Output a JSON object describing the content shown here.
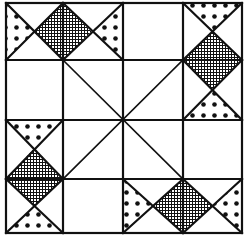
{
  "diagram": {
    "type": "quilt-block",
    "grid": {
      "rows": 4,
      "cols": 4
    },
    "colors": {
      "line": "#111111",
      "background": "#ffffff",
      "fill": "#111111"
    },
    "patterns": [
      "dots",
      "crosshatch"
    ],
    "hourglass_units": [
      {
        "position": "top-left",
        "cells": "r0c0-r0c1",
        "orientation": "horizontal"
      },
      {
        "position": "top-right",
        "cells": "r0c3-r1c3",
        "orientation": "vertical"
      },
      {
        "position": "bottom-left",
        "cells": "r2c0-r3c0",
        "orientation": "vertical"
      },
      {
        "position": "bottom-right",
        "cells": "r3c2-r3c3",
        "orientation": "horizontal"
      }
    ]
  }
}
